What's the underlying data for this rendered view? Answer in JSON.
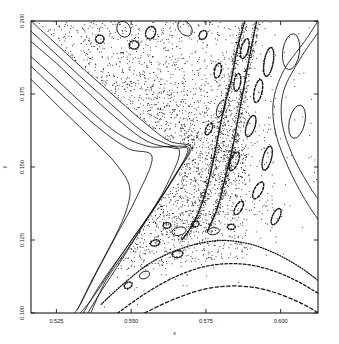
{
  "chart_data": {
    "type": "scatter",
    "title": "",
    "subtitle": "",
    "xlabel": "x",
    "ylabel": "y",
    "xlim": [
      0.5165,
      0.6125
    ],
    "ylim": [
      0.1,
      0.2
    ],
    "xticks": [
      0.525,
      0.55,
      0.575,
      0.6
    ],
    "xticklabels": [
      "0.525",
      "0.550",
      "0.575",
      "0.600"
    ],
    "yticks": [
      0.1,
      0.125,
      0.15,
      0.175,
      0.2
    ],
    "yticklabels": [
      "0.100",
      "0.125",
      "0.150",
      "0.175",
      "0.200"
    ],
    "grid": false,
    "legend": null,
    "frame": true,
    "annotations": [],
    "series": [
      {
        "name": "kam-invariant-curves-left",
        "kind": "line",
        "style": "solid",
        "curves": [
          {
            "points": [
              [
                0.5165,
                0.2
              ],
              [
                0.524,
                0.193
              ],
              [
                0.533,
                0.1845
              ],
              [
                0.543,
                0.1755
              ],
              [
                0.553,
                0.1665
              ],
              [
                0.5625,
                0.159
              ],
              [
                0.57,
                0.1568
              ],
              [
                0.566,
                0.149
              ],
              [
                0.56,
                0.1395
              ],
              [
                0.553,
                0.129
              ],
              [
                0.546,
                0.119
              ],
              [
                0.5395,
                0.1095
              ],
              [
                0.534,
                0.1
              ]
            ]
          },
          {
            "points": [
              [
                0.5165,
                0.1965
              ],
              [
                0.524,
                0.1895
              ],
              [
                0.5335,
                0.1805
              ],
              [
                0.5435,
                0.1713
              ],
              [
                0.554,
                0.162
              ],
              [
                0.563,
                0.1575
              ],
              [
                0.5695,
                0.1562
              ],
              [
                0.5645,
                0.147
              ],
              [
                0.558,
                0.1365
              ],
              [
                0.5505,
                0.1255
              ],
              [
                0.5435,
                0.115
              ],
              [
                0.537,
                0.105
              ],
              [
                0.533,
                0.1
              ]
            ]
          },
          {
            "points": [
              [
                0.5165,
                0.193
              ],
              [
                0.525,
                0.1855
              ],
              [
                0.5345,
                0.1765
              ],
              [
                0.5445,
                0.1672
              ],
              [
                0.555,
                0.159
              ],
              [
                0.564,
                0.1565
              ],
              [
                0.569,
                0.1558
              ],
              [
                0.5635,
                0.145
              ],
              [
                0.556,
                0.133
              ],
              [
                0.5485,
                0.1215
              ],
              [
                0.5415,
                0.111
              ],
              [
                0.5365,
                0.1
              ]
            ]
          },
          {
            "points": [
              [
                0.5165,
                0.1878
              ],
              [
                0.5255,
                0.1795
              ],
              [
                0.5355,
                0.17
              ],
              [
                0.546,
                0.1612
              ],
              [
                0.556,
                0.157
              ],
              [
                0.566,
                0.156
              ],
              [
                0.562,
                0.144
              ],
              [
                0.5545,
                0.131
              ],
              [
                0.547,
                0.1185
              ],
              [
                0.54,
                0.1075
              ],
              [
                0.5355,
                0.1
              ]
            ]
          },
          {
            "points": [
              [
                0.5165,
                0.1845
              ],
              [
                0.527,
                0.1745
              ],
              [
                0.539,
                0.1635
              ],
              [
                0.549,
                0.1563
              ],
              [
                0.557,
                0.1535
              ],
              [
                0.552,
                0.14
              ],
              [
                0.545,
                0.1265
              ],
              [
                0.5385,
                0.114
              ],
              [
                0.533,
                0.103
              ],
              [
                0.531,
                0.1
              ]
            ]
          },
          {
            "points": [
              [
                0.5165,
                0.18
              ],
              [
                0.5275,
                0.169
              ],
              [
                0.5375,
                0.159
              ],
              [
                0.545,
                0.151
              ],
              [
                0.5495,
                0.143
              ],
              [
                0.548,
                0.134
              ],
              [
                0.543,
                0.123
              ],
              [
                0.537,
                0.1115
              ],
              [
                0.532,
                0.101
              ]
            ]
          }
        ]
      },
      {
        "name": "separatrix-x-point",
        "kind": "point",
        "x": 0.5705,
        "y": 0.1565
      },
      {
        "name": "chaotic-sea",
        "kind": "scatter",
        "marker": "pixel",
        "n_points": 5200,
        "extent_note": "fills the wedge right of the KAM cusp, dense near the separatrix, thinning toward upper-right and lower-right"
      },
      {
        "name": "islands-upper",
        "kind": "closed-loops",
        "loops": [
          {
            "cx": 0.5475,
            "cy": 0.1972,
            "rx": 0.0022,
            "ry": 0.0028,
            "rot": -25,
            "style": "solid"
          },
          {
            "cx": 0.5565,
            "cy": 0.196,
            "rx": 0.0016,
            "ry": 0.0022,
            "rot": 20,
            "style": "dotted"
          },
          {
            "cx": 0.568,
            "cy": 0.1975,
            "rx": 0.002,
            "ry": 0.003,
            "rot": -40,
            "style": "solid"
          },
          {
            "cx": 0.5395,
            "cy": 0.1938,
            "rx": 0.0014,
            "ry": 0.0014,
            "rot": 0,
            "style": "dotted"
          },
          {
            "cx": 0.551,
            "cy": 0.1918,
            "rx": 0.0016,
            "ry": 0.0014,
            "rot": 0,
            "style": "dotted"
          },
          {
            "cx": 0.574,
            "cy": 0.1952,
            "rx": 0.0012,
            "ry": 0.0016,
            "rot": 30,
            "style": "dotted"
          }
        ]
      },
      {
        "name": "islands-right",
        "kind": "closed-loops",
        "loops": [
          {
            "cx": 0.6035,
            "cy": 0.1895,
            "rx": 0.0028,
            "ry": 0.0062,
            "rot": 8,
            "style": "solid"
          },
          {
            "cx": 0.6055,
            "cy": 0.1655,
            "rx": 0.0026,
            "ry": 0.0058,
            "rot": 12,
            "style": "solid"
          },
          {
            "cx": 0.596,
            "cy": 0.186,
            "rx": 0.0015,
            "ry": 0.005,
            "rot": 10,
            "style": "dotted"
          },
          {
            "cx": 0.588,
            "cy": 0.1905,
            "rx": 0.0012,
            "ry": 0.0035,
            "rot": 15,
            "style": "dashed"
          },
          {
            "cx": 0.5925,
            "cy": 0.176,
            "rx": 0.0013,
            "ry": 0.004,
            "rot": 12,
            "style": "dashed"
          },
          {
            "cx": 0.5855,
            "cy": 0.179,
            "rx": 0.0011,
            "ry": 0.003,
            "rot": 8,
            "style": "dashed"
          },
          {
            "cx": 0.59,
            "cy": 0.164,
            "rx": 0.0014,
            "ry": 0.0038,
            "rot": 18,
            "style": "dotted"
          },
          {
            "cx": 0.5845,
            "cy": 0.152,
            "rx": 0.0013,
            "ry": 0.0034,
            "rot": 22,
            "style": "dashed"
          },
          {
            "cx": 0.5955,
            "cy": 0.153,
            "rx": 0.0014,
            "ry": 0.0042,
            "rot": 15,
            "style": "dotted"
          },
          {
            "cx": 0.58,
            "cy": 0.17,
            "rx": 0.0012,
            "ry": 0.003,
            "rot": 20,
            "style": "solid"
          },
          {
            "cx": 0.579,
            "cy": 0.183,
            "rx": 0.0011,
            "ry": 0.0026,
            "rot": 12,
            "style": "dashed"
          },
          {
            "cx": 0.576,
            "cy": 0.163,
            "rx": 0.001,
            "ry": 0.0022,
            "rot": 25,
            "style": "dashed"
          },
          {
            "cx": 0.5925,
            "cy": 0.142,
            "rx": 0.0013,
            "ry": 0.0032,
            "rot": 28,
            "style": "dashed"
          },
          {
            "cx": 0.586,
            "cy": 0.136,
            "rx": 0.0011,
            "ry": 0.0026,
            "rot": 30,
            "style": "dashed"
          },
          {
            "cx": 0.5985,
            "cy": 0.133,
            "rx": 0.0012,
            "ry": 0.003,
            "rot": 25,
            "style": "dotted"
          }
        ]
      },
      {
        "name": "islands-lower",
        "kind": "closed-loops",
        "loops": [
          {
            "cx": 0.566,
            "cy": 0.128,
            "rx": 0.0024,
            "ry": 0.0014,
            "rot": -12,
            "style": "solid"
          },
          {
            "cx": 0.5775,
            "cy": 0.128,
            "rx": 0.002,
            "ry": 0.0012,
            "rot": -8,
            "style": "solid"
          },
          {
            "cx": 0.558,
            "cy": 0.124,
            "rx": 0.0016,
            "ry": 0.001,
            "rot": -15,
            "style": "dotted"
          },
          {
            "cx": 0.5655,
            "cy": 0.1202,
            "rx": 0.0018,
            "ry": 0.0012,
            "rot": -10,
            "style": "dotted"
          },
          {
            "cx": 0.5545,
            "cy": 0.113,
            "rx": 0.0018,
            "ry": 0.0012,
            "rot": -25,
            "style": "solid"
          },
          {
            "cx": 0.562,
            "cy": 0.13,
            "rx": 0.0013,
            "ry": 0.001,
            "rot": 0,
            "style": "dotted"
          },
          {
            "cx": 0.5715,
            "cy": 0.1305,
            "rx": 0.0012,
            "ry": 0.001,
            "rot": 0,
            "style": "dotted"
          },
          {
            "cx": 0.5835,
            "cy": 0.1295,
            "rx": 0.0013,
            "ry": 0.0009,
            "rot": 0,
            "style": "dotted"
          },
          {
            "cx": 0.549,
            "cy": 0.1095,
            "rx": 0.0014,
            "ry": 0.001,
            "rot": -30,
            "style": "dotted"
          }
        ]
      },
      {
        "name": "kam-curves-lower-dotted",
        "kind": "line",
        "style": "dotted",
        "curves": [
          {
            "points": [
              [
                0.54,
                0.103
              ],
              [
                0.548,
                0.1105
              ],
              [
                0.557,
                0.1175
              ],
              [
                0.568,
                0.1225
              ],
              [
                0.579,
                0.1248
              ],
              [
                0.589,
                0.1238
              ],
              [
                0.598,
                0.1205
              ],
              [
                0.606,
                0.116
              ],
              [
                0.6125,
                0.1112
              ]
            ]
          },
          {
            "points": [
              [
                0.5455,
                0.1
              ],
              [
                0.5545,
                0.1065
              ],
              [
                0.565,
                0.1125
              ],
              [
                0.576,
                0.1162
              ],
              [
                0.587,
                0.1168
              ],
              [
                0.5965,
                0.1148
              ],
              [
                0.605,
                0.1112
              ],
              [
                0.6125,
                0.1068
              ]
            ]
          },
          {
            "points": [
              [
                0.5545,
                0.1
              ],
              [
                0.565,
                0.105
              ],
              [
                0.576,
                0.1085
              ],
              [
                0.587,
                0.1092
              ],
              [
                0.5965,
                0.1075
              ],
              [
                0.6055,
                0.104
              ],
              [
                0.6125,
                0.1002
              ]
            ]
          }
        ]
      },
      {
        "name": "kam-curves-right-smooth",
        "kind": "line",
        "style": "solid",
        "curves": [
          {
            "points": [
              [
                0.6125,
                0.2
              ],
              [
                0.608,
                0.193
              ],
              [
                0.601,
                0.183
              ],
              [
                0.5975,
                0.172
              ],
              [
                0.5985,
                0.161
              ],
              [
                0.6025,
                0.15
              ],
              [
                0.6075,
                0.14
              ],
              [
                0.6125,
                0.132
              ]
            ]
          },
          {
            "points": [
              [
                0.6125,
                0.196
              ],
              [
                0.6065,
                0.187
              ],
              [
                0.601,
                0.176
              ],
              [
                0.6005,
                0.165
              ],
              [
                0.604,
                0.154
              ],
              [
                0.609,
                0.1445
              ],
              [
                0.6125,
                0.139
              ]
            ]
          }
        ]
      },
      {
        "name": "stochastic-layer-dotted-band",
        "kind": "line",
        "style": "dotted-dense",
        "curves": [
          {
            "points": [
              [
                0.588,
                0.2
              ],
              [
                0.5855,
                0.1905
              ],
              [
                0.5835,
                0.18
              ],
              [
                0.581,
                0.17
              ],
              [
                0.579,
                0.16
              ],
              [
                0.577,
                0.15
              ],
              [
                0.5745,
                0.14
              ],
              [
                0.571,
                0.131
              ],
              [
                0.567,
                0.125
              ]
            ]
          },
          {
            "points": [
              [
                0.592,
                0.2
              ],
              [
                0.59,
                0.19
              ],
              [
                0.588,
                0.179
              ],
              [
                0.586,
                0.168
              ],
              [
                0.584,
                0.157
              ],
              [
                0.5815,
                0.1465
              ],
              [
                0.579,
                0.1365
              ],
              [
                0.5755,
                0.128
              ]
            ]
          }
        ]
      }
    ]
  },
  "axes": {
    "x_label": "x",
    "y_label": "y",
    "x_tick_labels": [
      "0.525",
      "0.550",
      "0.575",
      "0.600"
    ],
    "y_tick_labels": [
      "0.100",
      "0.125",
      "0.150",
      "0.175",
      "0.200"
    ]
  },
  "colors": {
    "ink": "#151515",
    "background": "#ffffff",
    "frame": "#1a1a1a"
  }
}
